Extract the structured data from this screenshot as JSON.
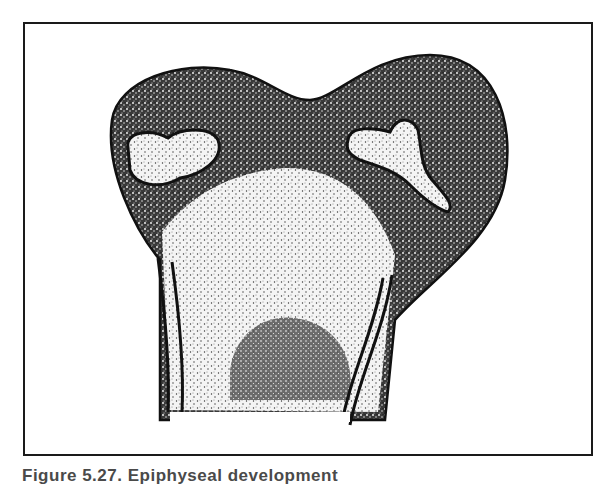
{
  "figure": {
    "caption": "Figure 5.27. Epiphyseal development",
    "colors": {
      "ink": "#111111",
      "stipple_dark": "#2a2a2a",
      "stipple_light": "#e8e8e8",
      "background": "#ffffff",
      "frame": "#1a1a1a"
    },
    "regions": [
      {
        "name": "cartilaginous-head",
        "shade": "dark-stipple"
      },
      {
        "name": "left-secondary-ossification-center",
        "shade": "light-stipple"
      },
      {
        "name": "right-secondary-ossification-center",
        "shade": "light-stipple"
      },
      {
        "name": "ossified-metaphysis",
        "shade": "light-stipple"
      },
      {
        "name": "marrow-cavity",
        "shade": "dark-stipple"
      },
      {
        "name": "cortical-shaft-walls",
        "shade": "ink-lines"
      }
    ]
  }
}
